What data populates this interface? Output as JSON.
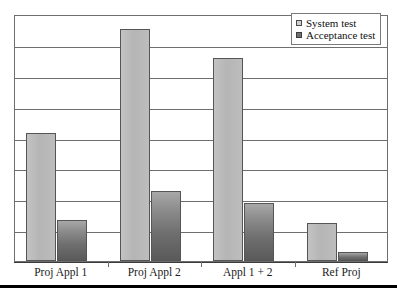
{
  "chart_data": {
    "type": "bar",
    "title": "",
    "subtitle": "",
    "xlabel": "",
    "ylabel": "",
    "categories": [
      "Proj Appl 1",
      "Proj Appl 2",
      "Appl 1 + 2",
      "Ref Proj"
    ],
    "series": [
      {
        "name": "System test",
        "values": [
          4.4,
          8.0,
          7.0,
          1.3
        ],
        "color": "#b9b9b9"
      },
      {
        "name": "Acceptance test",
        "values": [
          1.4,
          2.4,
          2.0,
          0.3
        ],
        "color": "#6d6d6d"
      }
    ],
    "ylim": [
      0,
      8.5
    ],
    "y_tick_labels": [],
    "gridlines": {
      "count": 7,
      "visible": true,
      "color": "#6e6e6e"
    },
    "grid": true,
    "legend_position": "top-right",
    "axis_tick_labels_visible": false
  },
  "legend": {
    "entries": [
      {
        "label": "System test",
        "swatch": "light-gray-square"
      },
      {
        "label": "Acceptance test",
        "swatch": "dark-gray-square"
      }
    ]
  },
  "axis": {
    "categories": [
      "Proj Appl 1",
      "Proj Appl 2",
      "Appl 1 + 2",
      "Ref Proj"
    ]
  },
  "colors": {
    "series_system": "#b9b9b9",
    "series_acceptance": "#6d6d6d",
    "gridline": "#6e6e6e",
    "frame": "#6e6e6e",
    "rule": "#000000"
  }
}
